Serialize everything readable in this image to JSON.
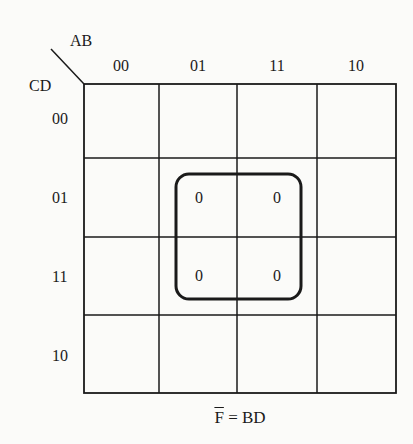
{
  "kmap": {
    "col_var": "AB",
    "row_var": "CD",
    "col_headers": [
      "00",
      "01",
      "11",
      "10"
    ],
    "row_headers": [
      "00",
      "01",
      "11",
      "10"
    ],
    "cells": [
      [
        "",
        "",
        "",
        ""
      ],
      [
        "",
        "0",
        "0",
        ""
      ],
      [
        "",
        "0",
        "0",
        ""
      ],
      [
        "",
        "",
        "",
        ""
      ]
    ],
    "groups": [
      {
        "cells": [
          [
            1,
            1
          ],
          [
            1,
            2
          ],
          [
            2,
            1
          ],
          [
            2,
            2
          ]
        ],
        "term": "BD"
      }
    ],
    "colors": {
      "line": "#1a1a1a",
      "background": "#fbfbf9"
    }
  },
  "formula": {
    "lhs": "F",
    "lhs_complemented": true,
    "eq": "=",
    "rhs": "BD"
  }
}
